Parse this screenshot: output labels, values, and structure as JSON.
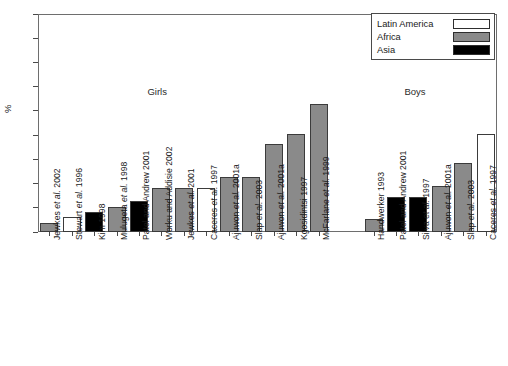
{
  "chart_data": {
    "type": "bar",
    "title": "",
    "xlabel": "",
    "ylabel": "%",
    "ylim": [
      0,
      45
    ],
    "ytick_step": 5,
    "yticks": [
      0,
      5,
      10,
      15,
      20,
      25,
      30,
      35,
      40,
      45
    ],
    "grid": false,
    "legend_position": "top-right",
    "legend": [
      {
        "name": "Latin America",
        "color": "#ffffff",
        "swatch": "white"
      },
      {
        "name": "Africa",
        "color": "#8a8a8a",
        "swatch": "gray"
      },
      {
        "name": "Asia",
        "color": "#000000",
        "swatch": "black"
      }
    ],
    "group_labels": [
      {
        "text": "Girls",
        "group": "girls"
      },
      {
        "text": "Boys",
        "group": "boys"
      }
    ],
    "categories": [
      "Jewkes et al. 2002",
      "Stewart et al. 1996",
      "Kim 1998",
      "Mulugeta et al. 1998",
      "Patel and Andrew 2001",
      "Worku and Addisie 2002",
      "Jewkes et al. 2001",
      "Caceres et al. 1997",
      "Ajuwon et al. 2001a",
      "Slap et al. 2003",
      "Ajuwon et al. 2001a",
      "Kgosidintsi 1997",
      "McFarlane et al. 1999",
      "Handwerker 1993",
      "Patel and Andrew 2001",
      "Silva et al. 1997",
      "Ajuwon et al. 2001a",
      "Slap et al. 2003",
      "Caceres et al. 1997"
    ],
    "values": [
      1.9,
      3.1,
      4.1,
      5.2,
      6.3,
      9.0,
      9.1,
      9.1,
      11.3,
      11.3,
      18.2,
      20.3,
      26.4,
      2.6,
      7.3,
      7.3,
      9.4,
      14.2,
      20.2
    ],
    "bars": [
      {
        "label": "Jewkes et al. 2002",
        "italic": "Jewkes et al. 2002",
        "value": 1.9,
        "region": "Africa",
        "group": "girls"
      },
      {
        "label": "Stewart et al. 1996",
        "italic": "Stewart et al. 1996",
        "value": 3.1,
        "region": "Latin America",
        "group": "girls"
      },
      {
        "label": "Kim 1998",
        "italic": "Kim 1998",
        "value": 4.1,
        "region": "Asia",
        "group": "girls"
      },
      {
        "label": "Mulugeta et al. 1998",
        "italic": "Mulugeta et al. 1998",
        "value": 5.2,
        "region": "Africa",
        "group": "girls"
      },
      {
        "label": "Patel and Andrew 2001",
        "italic": "Patel and Andrew 2001",
        "value": 6.3,
        "region": "Asia",
        "group": "girls"
      },
      {
        "label": "Worku and Addisie 2002",
        "italic": "Worku and Addisie 2002",
        "value": 9.0,
        "region": "Africa",
        "group": "girls"
      },
      {
        "label": "Jewkes et al. 2001",
        "italic": "Jewkes et al. 2001",
        "value": 9.1,
        "region": "Africa",
        "group": "girls"
      },
      {
        "label": "Caceres et al. 1997",
        "italic": "Caceres et al. 1997",
        "value": 9.1,
        "region": "Latin America",
        "group": "girls"
      },
      {
        "label": "Ajuwon et al. 2001a",
        "italic": "Ajuwon et al. 2001a",
        "value": 11.3,
        "region": "Africa",
        "group": "girls"
      },
      {
        "label": "Slap et al. 2003",
        "italic": "Slap et al. 2003",
        "value": 11.3,
        "region": "Africa",
        "group": "girls"
      },
      {
        "label": "Ajuwon et al. 2001a",
        "italic": "Ajuwon et al. 2001a",
        "value": 18.2,
        "region": "Africa",
        "group": "girls"
      },
      {
        "label": "Kgosidintsi 1997",
        "italic": "Kgosidintsi 1997",
        "value": 20.3,
        "region": "Africa",
        "group": "girls"
      },
      {
        "label": "McFarlane et al. 1999",
        "italic": "McFarlane et al. 1999",
        "value": 26.4,
        "region": "Africa",
        "group": "girls"
      },
      {
        "label": "Handwerker 1993",
        "italic": "Handwerker 1993",
        "value": 2.6,
        "region": "Africa",
        "group": "boys"
      },
      {
        "label": "Patel and Andrew 2001",
        "italic": "Patel and Andrew 2001",
        "value": 7.3,
        "region": "Asia",
        "group": "boys"
      },
      {
        "label": "Silva et al. 1997",
        "italic": "Silva et al. 1997",
        "value": 7.3,
        "region": "Asia",
        "group": "boys"
      },
      {
        "label": "Ajuwon et al. 2001a",
        "italic": "Ajuwon et al. 2001a",
        "value": 9.4,
        "region": "Africa",
        "group": "boys"
      },
      {
        "label": "Slap et al. 2003",
        "italic": "Slap et al. 2003",
        "value": 14.2,
        "region": "Africa",
        "group": "boys"
      },
      {
        "label": "Caceres et al. 1997",
        "italic": "Caceres et al. 1997",
        "value": 20.2,
        "region": "Latin America",
        "group": "boys"
      }
    ]
  }
}
